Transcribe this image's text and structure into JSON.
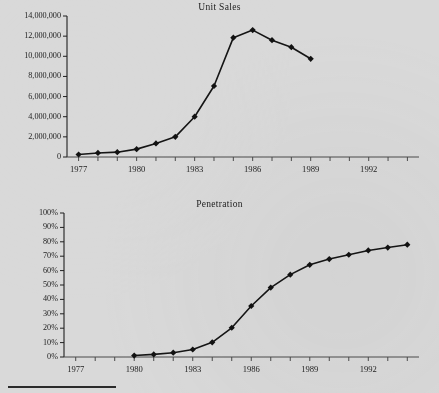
{
  "document": {
    "background_color": "#d9d9d9",
    "ink_color": "#1a1a1a",
    "footer_rule": "horizontal-rule"
  },
  "chart_data": [
    {
      "type": "line",
      "title": "Unit Sales",
      "xlabel": "",
      "ylabel": "",
      "grid": false,
      "legend": "none",
      "marker": "diamond",
      "xlim": [
        1976.4,
        1994.6
      ],
      "ylim": [
        0,
        14000000
      ],
      "xticks": [
        1977,
        1978,
        1979,
        1980,
        1981,
        1982,
        1983,
        1984,
        1985,
        1986,
        1987,
        1988,
        1989,
        1990,
        1991,
        1992,
        1993,
        1994
      ],
      "xticklabels": [
        "1977",
        "",
        "",
        "1980",
        "",
        "",
        "1983",
        "",
        "",
        "1986",
        "",
        "",
        "1989",
        "",
        "",
        "1992",
        "",
        ""
      ],
      "yticks": [
        0,
        2000000,
        4000000,
        6000000,
        8000000,
        10000000,
        12000000,
        14000000
      ],
      "yticklabels": [
        "0",
        "2,000,000",
        "4,000,000",
        "6,000,000",
        "8,000,000",
        "10,000,000",
        "12,000,000",
        "14,000,000"
      ],
      "x": [
        1977,
        1978,
        1979,
        1980,
        1981,
        1982,
        1983,
        1984,
        1985,
        1986,
        1987,
        1988,
        1989
      ],
      "values": [
        250000,
        400000,
        480000,
        780000,
        1350000,
        2000000,
        4000000,
        7050000,
        11850000,
        12600000,
        11600000,
        10900000,
        9750000
      ]
    },
    {
      "type": "line",
      "title": "Penetration",
      "xlabel": "",
      "ylabel": "",
      "grid": false,
      "legend": "none",
      "marker": "diamond",
      "xlim": [
        1976.4,
        1994.6
      ],
      "ylim": [
        0,
        100
      ],
      "xticks": [
        1977,
        1978,
        1979,
        1980,
        1981,
        1982,
        1983,
        1984,
        1985,
        1986,
        1987,
        1988,
        1989,
        1990,
        1991,
        1992,
        1993,
        1994
      ],
      "xticklabels": [
        "1977",
        "",
        "",
        "1980",
        "",
        "",
        "1983",
        "",
        "",
        "1986",
        "",
        "",
        "1989",
        "",
        "",
        "1992",
        "",
        ""
      ],
      "yticks": [
        0,
        10,
        20,
        30,
        40,
        50,
        60,
        70,
        80,
        90,
        100
      ],
      "yticklabels": [
        "0%",
        "10%",
        "20%",
        "30%",
        "40%",
        "50%",
        "60%",
        "70%",
        "80%",
        "90%",
        "100%"
      ],
      "x": [
        1980,
        1981,
        1982,
        1983,
        1984,
        1985,
        1986,
        1987,
        1988,
        1989,
        1990,
        1991,
        1992,
        1993,
        1994
      ],
      "values": [
        1,
        1.8,
        3,
        5.2,
        10.2,
        20.3,
        35.4,
        48.2,
        57.2,
        64,
        68,
        71,
        74,
        76,
        78
      ]
    }
  ]
}
